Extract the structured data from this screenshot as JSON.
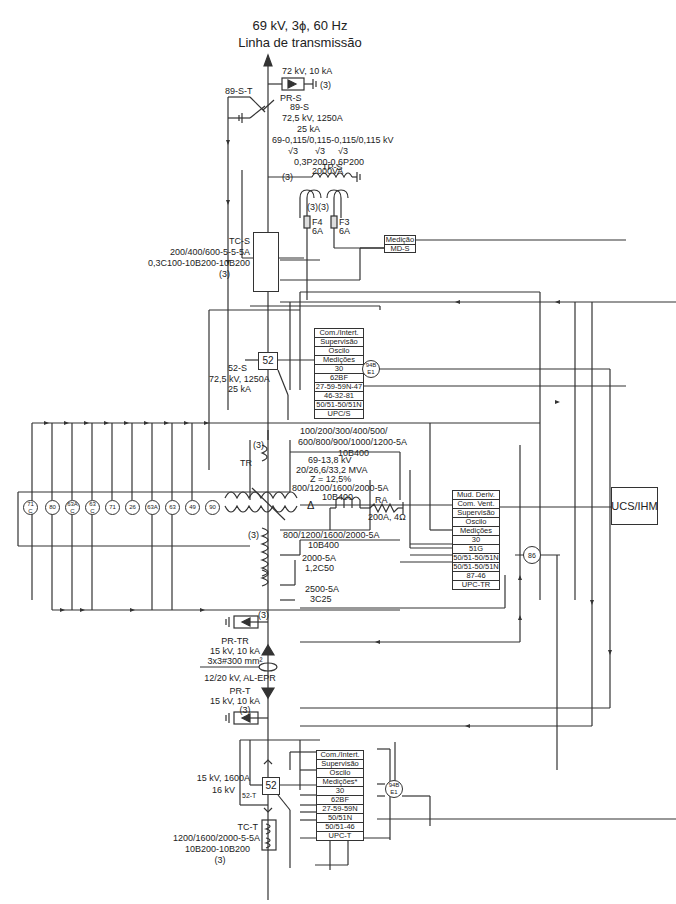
{
  "header": {
    "line1": "69 kV, 3ϕ, 60 Hz",
    "line2": "Linha de transmissão"
  },
  "incoming": {
    "surge_arrester": {
      "name": "PR-S",
      "rating": "72 kV, 10 kA",
      "qty": "(3)"
    },
    "ground_switch": {
      "name": "89-S-T"
    },
    "disconnector": {
      "name": "89-S",
      "rating1": "72,5 kV, 1250A",
      "rating2": "25 kA"
    },
    "vt": {
      "ratio": "69-0,115/0,115-0,115/0,115 kV",
      "sqrt": [
        "√3",
        "√3",
        "√3"
      ],
      "accuracy": "0,3P200-0,6P200",
      "power": "2000VA",
      "name": "TP-S",
      "qty_primary": "(3)",
      "qty_secondary": "(3)(3)",
      "fuses": [
        {
          "name": "F4",
          "rating": "6A"
        },
        {
          "name": "F3",
          "rating": "6A"
        }
      ]
    },
    "ct": {
      "name": "TC-S",
      "ratio": "200/400/600-5-5-5A",
      "accuracy": "0,3C100-10B200-10B200",
      "qty": "(3)"
    },
    "metering": {
      "line1": "Medição",
      "line2": "MD-S"
    },
    "breaker": {
      "symbol": "52",
      "name": "52-S",
      "rating1": "72,5 kV, 1250A",
      "rating2": "25 kA"
    },
    "panel_s": [
      "Com./Intert.",
      "Supervisão",
      "Oscilo",
      "Medições",
      "30",
      "62BF",
      "27-59-59N-47",
      "46-32-81",
      "50/51-50/51N",
      "UPC/S"
    ],
    "relay_94b": {
      "line1": "94B",
      "line2": "E1"
    }
  },
  "transformer": {
    "name": "TR",
    "qty": "(3)",
    "bushing_ct_hv": {
      "ratio_a": "100/200/300/400/500/",
      "ratio_b": "600/800/900/1000/1200-5A",
      "accuracy": "10B400"
    },
    "rating": {
      "voltage": "69-13,8 kV",
      "power": "20/26,6/33,2 MVA",
      "impedance": "Z = 12,5%",
      "ct": "800/1200/1600/2000-5A",
      "ct_acc": "10B400"
    },
    "lv_ct1": {
      "ratio": "800/1200/1600/2000-5A",
      "accuracy": "10B400",
      "qty": "(3)"
    },
    "lv_ct2": {
      "ratio": "2000-5A",
      "accuracy": "1,2C50"
    },
    "lv_ct3": {
      "ratio": "2500-5A",
      "accuracy": "3C25"
    },
    "grounding_resistor": {
      "name": "RA",
      "rating": "200A, 4Ω"
    },
    "aux_devices": [
      {
        "top": "71",
        "bot": "C"
      },
      {
        "top": "80",
        "bot": ""
      },
      {
        "top": "63A",
        "bot": "C"
      },
      {
        "top": "63",
        "bot": "C"
      },
      {
        "top": "71",
        "bot": ""
      },
      {
        "top": "26",
        "bot": ""
      },
      {
        "top": "63A",
        "bot": ""
      },
      {
        "top": "63",
        "bot": ""
      },
      {
        "top": "49",
        "bot": ""
      },
      {
        "top": "90",
        "bot": ""
      }
    ],
    "panel_tr": [
      "Mud. Deriv.",
      "Com. Vent.",
      "Supervisão",
      "Oscilo",
      "Medições",
      "30",
      "51G",
      "50/51-50/51N",
      "50/51-50/51N",
      "87-46",
      "UPC-TR"
    ],
    "lockout": "86",
    "scada": "UCS/IHM"
  },
  "cable": {
    "arrester_tr": {
      "name": "PR-TR",
      "rating": "15 kV, 10 kA",
      "qty": "(3)"
    },
    "section": "3x3#300 mm²",
    "insulation": "12/20 kV, AL-EPR",
    "arrester_t": {
      "name": "PR-T",
      "rating": "15 kV, 10 kA",
      "qty": "(3)"
    }
  },
  "lv_bay": {
    "breaker": {
      "symbol": "52",
      "name": "52-T",
      "rating1": "15 kV, 1600A",
      "rating2": "16 kV"
    },
    "panel_t": [
      "Com./Intert.",
      "Supervisão",
      "Oscilo",
      "Medições*",
      "30",
      "62BF",
      "27-59-59N",
      "50/51N",
      "50/51-46",
      "UPC-T"
    ],
    "relay_94b": {
      "line1": "94B",
      "line2": "E1"
    },
    "ct": {
      "name": "TC-T",
      "ratio": "1200/1600/2000-5-5A",
      "accuracy": "10B200-10B200",
      "qty": "(3)"
    }
  },
  "colors": {
    "line": "#333333",
    "background": "#ffffff"
  }
}
